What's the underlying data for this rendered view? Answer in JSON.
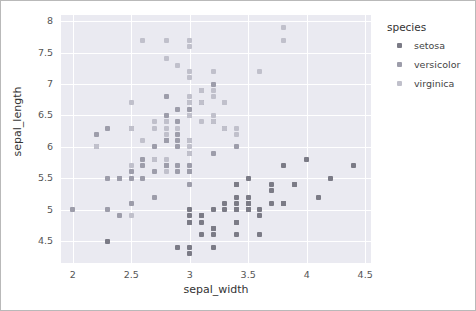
{
  "figure": {
    "background": "#ffffff",
    "border_color": "#b9b9b9",
    "plot_background": "#eaeaf1",
    "grid_color": "#ffffff"
  },
  "chart_data": {
    "type": "scatter",
    "title": "",
    "xlabel": "sepal_width",
    "ylabel": "sepal_length",
    "xlim": [
      1.9,
      4.55
    ],
    "ylim": [
      4.15,
      8.1
    ],
    "xticks": [
      "2",
      "2.5",
      "3",
      "3.5",
      "4",
      "4.5"
    ],
    "xtick_values": [
      2,
      2.5,
      3,
      3.5,
      4,
      4.5
    ],
    "yticks": [
      "4.5",
      "5",
      "5.5",
      "6",
      "6.5",
      "7",
      "7.5",
      "8"
    ],
    "ytick_values": [
      4.5,
      5,
      5.5,
      6,
      6.5,
      7,
      7.5,
      8
    ],
    "grid": true,
    "legend_position": "right",
    "legend_title": "species",
    "series": [
      {
        "name": "setosa",
        "color": "#7b7b86",
        "x": [
          3.5,
          3.0,
          3.2,
          3.1,
          3.6,
          3.9,
          3.4,
          3.4,
          2.9,
          3.1,
          3.7,
          3.4,
          3.0,
          3.0,
          4.0,
          4.4,
          3.9,
          3.5,
          3.8,
          3.8,
          3.4,
          3.7,
          3.6,
          3.3,
          3.4,
          3.0,
          3.4,
          3.5,
          3.4,
          3.2,
          3.1,
          3.4,
          4.1,
          4.2,
          3.1,
          3.2,
          3.5,
          3.6,
          3.0,
          3.4,
          3.5,
          2.3,
          3.2,
          3.5,
          3.8,
          3.0,
          3.8,
          3.2,
          3.7,
          3.3
        ],
        "y": [
          5.1,
          4.9,
          4.7,
          4.6,
          5.0,
          5.4,
          4.6,
          5.0,
          4.4,
          4.9,
          5.4,
          4.8,
          4.8,
          4.3,
          5.8,
          5.7,
          5.4,
          5.1,
          5.7,
          5.1,
          5.4,
          5.1,
          4.6,
          5.1,
          4.8,
          5.0,
          5.0,
          5.2,
          5.2,
          4.7,
          4.8,
          5.4,
          5.2,
          5.5,
          4.9,
          5.0,
          5.5,
          4.9,
          4.4,
          5.1,
          5.0,
          4.5,
          4.4,
          5.0,
          5.1,
          4.8,
          5.1,
          4.6,
          5.3,
          5.0
        ]
      },
      {
        "name": "versicolor",
        "color": "#9d9daa",
        "x": [
          3.2,
          3.2,
          3.1,
          2.3,
          2.8,
          2.8,
          3.3,
          2.4,
          2.9,
          2.7,
          2.0,
          3.0,
          2.2,
          2.9,
          2.9,
          3.1,
          3.0,
          2.7,
          2.2,
          2.5,
          3.2,
          2.8,
          2.5,
          2.8,
          2.9,
          3.0,
          2.8,
          3.0,
          2.9,
          2.6,
          2.4,
          2.4,
          2.7,
          2.7,
          3.0,
          3.4,
          3.1,
          2.3,
          3.0,
          2.5,
          2.6,
          3.0,
          2.6,
          2.3,
          2.7,
          3.0,
          2.9,
          2.9,
          2.5,
          2.8
        ],
        "y": [
          7.0,
          6.4,
          6.9,
          5.5,
          6.5,
          5.7,
          6.3,
          4.9,
          6.6,
          5.2,
          5.0,
          5.9,
          6.0,
          6.1,
          5.6,
          6.7,
          5.6,
          5.8,
          6.2,
          5.6,
          5.9,
          6.1,
          6.3,
          6.1,
          6.4,
          6.6,
          6.8,
          6.7,
          6.0,
          5.7,
          5.5,
          5.5,
          5.8,
          6.0,
          5.4,
          6.0,
          6.7,
          6.3,
          5.6,
          5.5,
          5.5,
          6.1,
          5.8,
          5.0,
          5.6,
          5.7,
          5.7,
          6.2,
          5.1,
          5.7
        ]
      },
      {
        "name": "virginica",
        "color": "#c0c0cb",
        "x": [
          3.3,
          2.7,
          3.0,
          2.9,
          3.0,
          3.0,
          2.5,
          2.9,
          2.5,
          3.6,
          3.2,
          2.7,
          3.0,
          2.5,
          2.8,
          3.2,
          3.0,
          3.8,
          2.6,
          2.2,
          3.2,
          2.8,
          2.8,
          2.7,
          3.3,
          3.2,
          2.8,
          3.0,
          2.8,
          3.0,
          2.8,
          3.8,
          2.8,
          2.8,
          2.6,
          3.0,
          3.4,
          3.1,
          3.0,
          3.1,
          3.1,
          3.1,
          2.7,
          3.2,
          3.3,
          3.0,
          2.5,
          3.0,
          3.4,
          3.0
        ],
        "y": [
          6.3,
          5.8,
          7.1,
          6.3,
          6.5,
          7.6,
          4.9,
          7.3,
          6.7,
          7.2,
          6.5,
          6.4,
          6.8,
          5.7,
          5.8,
          6.4,
          6.5,
          7.7,
          7.7,
          6.0,
          6.9,
          5.6,
          7.7,
          6.3,
          6.7,
          7.2,
          6.2,
          6.1,
          6.4,
          7.2,
          7.4,
          7.9,
          6.4,
          6.3,
          6.1,
          7.7,
          6.3,
          6.4,
          6.0,
          6.9,
          6.7,
          6.9,
          5.8,
          6.8,
          6.7,
          6.7,
          6.3,
          6.5,
          6.2,
          5.9
        ]
      }
    ]
  }
}
